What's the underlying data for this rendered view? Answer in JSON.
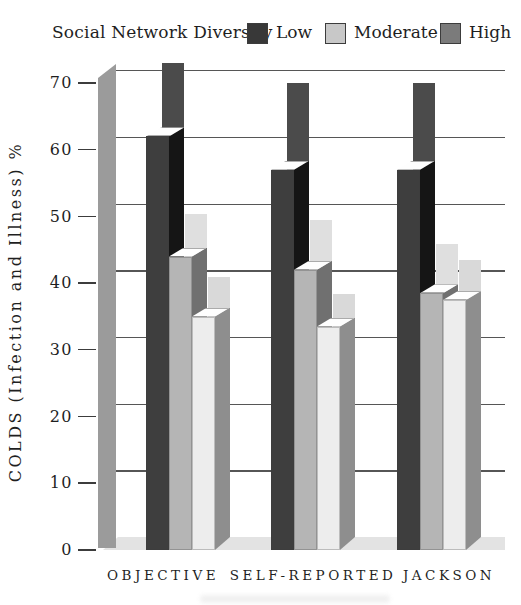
{
  "legend": {
    "title": "Social Network Diversity",
    "items": [
      {
        "label": "Low",
        "key": "low",
        "swatch_color": "#383838"
      },
      {
        "label": "Moderate",
        "key": "moderate",
        "swatch_color": "#c8c8c8"
      },
      {
        "label": "High",
        "key": "high",
        "swatch_color": "#7b7b7b"
      }
    ]
  },
  "chart_data": {
    "type": "bar",
    "title": "Social Network Diversity",
    "ylabel": "COLDS  (Infection and Illness) %",
    "xlabel": "",
    "categories": [
      "OBJECTIVE",
      "SELF-REPORTED",
      "JACKSON"
    ],
    "ylim": [
      0,
      70
    ],
    "yticks": [
      70,
      60,
      50,
      40,
      30,
      20,
      10,
      0
    ],
    "grid": true,
    "legend_position": "top",
    "style": "3d columns: each diversity level has a taller flat back column and a shorter beveled front column",
    "series": [
      {
        "name": "Low",
        "key": "low",
        "bars": [
          {
            "category": "OBJECTIVE",
            "front": 62,
            "back": 71
          },
          {
            "category": "SELF-REPORTED",
            "front": 57,
            "back": 68
          },
          {
            "category": "JACKSON",
            "front": 57,
            "back": 68
          }
        ]
      },
      {
        "name": "Moderate",
        "key": "moderate",
        "bars": [
          {
            "category": "OBJECTIVE",
            "front": 44,
            "back": 48.5
          },
          {
            "category": "SELF-REPORTED",
            "front": 42,
            "back": 47.5
          },
          {
            "category": "JACKSON",
            "front": 38.5,
            "back": 44
          }
        ]
      },
      {
        "name": "High",
        "key": "high",
        "bars": [
          {
            "category": "OBJECTIVE",
            "front": 35,
            "back": 39
          },
          {
            "category": "SELF-REPORTED",
            "front": 33.5,
            "back": 36.5
          },
          {
            "category": "JACKSON",
            "front": 37.5,
            "back": 41.5
          }
        ]
      }
    ]
  },
  "colors": {
    "low": {
      "front": "#3e3e3e",
      "side": "#151515",
      "back": "#4b4b4b"
    },
    "moderate": {
      "front": "#b5b5b5",
      "side": "#707070",
      "back": "#dfdfdf"
    },
    "high": {
      "front": "#ededed",
      "side": "#8e8e8e",
      "back": "#d9d9d9"
    },
    "top_face": "#fefefe",
    "axis_column": "#9b9b9b",
    "floor": "#e3e3e3",
    "gridline": "#565656",
    "text": "#1f1f1f",
    "background": "#ffffff"
  }
}
